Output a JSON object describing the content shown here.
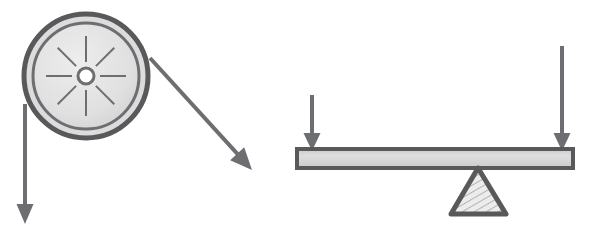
{
  "figure": {
    "background_color": "#ffffff",
    "width": 589,
    "height": 240
  },
  "palette": {
    "stroke_dark": "#58595b",
    "stroke_mid": "#6d6e71",
    "fill_light": "#e2e2e2",
    "fill_beam": "#d2d2d2",
    "fill_wheel_outer": "#dcdcdc",
    "fill_wheel_inner": "#e6e6e6",
    "hub_fill": "#ffffff",
    "hatch_color": "#9a9a9a"
  },
  "pulley": {
    "label": "pulley-wheel",
    "center_x": 86,
    "center_y": 76,
    "outer_radius": 62,
    "outer_stroke_width": 5,
    "inner_ring_radius": 53,
    "inner_ring_stroke_width": 3,
    "disc_radius": 46,
    "hub_radius": 8,
    "hub_stroke_width": 3,
    "spoke_count": 8,
    "spoke_inner_radius": 14,
    "spoke_outer_radius": 40,
    "spoke_stroke_width": 2,
    "spoke_angles_deg": [
      0,
      45,
      90,
      135,
      180,
      225,
      270,
      315
    ]
  },
  "arrows": {
    "pulley_load": {
      "label": "pulley-load-arrow",
      "description": "downward force arrow on left side of pulley",
      "x1": 25,
      "y1": 104,
      "x2": 25,
      "y2": 224,
      "shaft_width": 4,
      "head_width": 17,
      "head_length": 20,
      "direction": "down"
    },
    "pulley_effort": {
      "label": "pulley-effort-arrow",
      "description": "diagonal force arrow from pulley rim pointing down-right",
      "x1": 150,
      "y1": 58,
      "x2": 252,
      "y2": 170,
      "shaft_width": 4,
      "head_width": 19,
      "head_length": 22,
      "direction": "down-right"
    },
    "lever_effort": {
      "label": "lever-effort-arrow",
      "description": "short downward force arrow on left end of lever beam",
      "x1": 312,
      "y1": 95,
      "x2": 312,
      "y2": 151,
      "shaft_width": 4,
      "head_width": 17,
      "head_length": 18,
      "direction": "down"
    },
    "lever_load": {
      "label": "lever-load-arrow",
      "description": "long downward force arrow on right end of lever beam",
      "x1": 562,
      "y1": 46,
      "x2": 562,
      "y2": 151,
      "shaft_width": 4,
      "head_width": 17,
      "head_length": 18,
      "direction": "down"
    }
  },
  "lever": {
    "beam": {
      "label": "lever-beam",
      "x": 297,
      "y": 149,
      "width": 276,
      "height": 19,
      "stroke_width": 4
    },
    "fulcrum": {
      "label": "lever-fulcrum",
      "apex_x": 478,
      "apex_y": 168,
      "base_left_x": 451,
      "base_right_x": 506,
      "base_y": 214,
      "stroke_width": 5,
      "corner_radius": 5,
      "hatch_spacing": 6,
      "hatch_angle_deg": 60
    }
  }
}
